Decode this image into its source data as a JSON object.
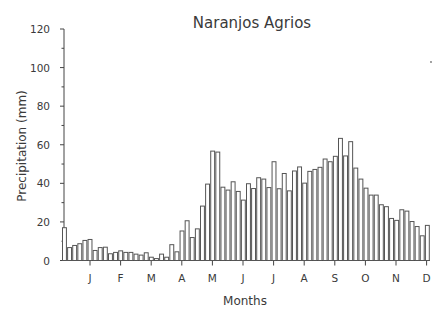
{
  "chart_data": {
    "type": "bar",
    "title": "Naranjos Agrios",
    "xlabel": "Months",
    "ylabel": "Precipitation (mm)",
    "ylim": [
      0,
      120
    ],
    "yticks": [
      0,
      20,
      40,
      60,
      80,
      100,
      120
    ],
    "yminor_step": 10,
    "month_ticks": [
      "J",
      "F",
      "M",
      "A",
      "M",
      "J",
      "J",
      "A",
      "S",
      "O",
      "N",
      "D"
    ],
    "grid": false,
    "legend": null,
    "bar_style": {
      "fill": "#ffffff",
      "stroke": "#555555"
    },
    "values": [
      17,
      6.7,
      7.8,
      8.7,
      10.4,
      10.9,
      5.2,
      6.7,
      6.9,
      3.5,
      4.2,
      5.0,
      4.2,
      4.2,
      3.3,
      2.8,
      4.0,
      1.7,
      1.0,
      3.3,
      1.7,
      8.2,
      4.5,
      15.3,
      20.6,
      11.9,
      16.4,
      28.2,
      39.6,
      56.7,
      56.2,
      38.0,
      36.5,
      40.8,
      35.8,
      31.3,
      39.8,
      37.3,
      42.9,
      42.2,
      37.8,
      51.2,
      37.2,
      45.1,
      36.1,
      46.4,
      48.5,
      40.1,
      46.2,
      47.2,
      48.3,
      52.6,
      51.2,
      54.0,
      63.3,
      54.2,
      61.6,
      47.9,
      42.2,
      37.5,
      33.9,
      33.9,
      28.9,
      27.9,
      21.8,
      20.8,
      26.3,
      25.6,
      20.2,
      17.6,
      12.8,
      18.2
    ]
  }
}
